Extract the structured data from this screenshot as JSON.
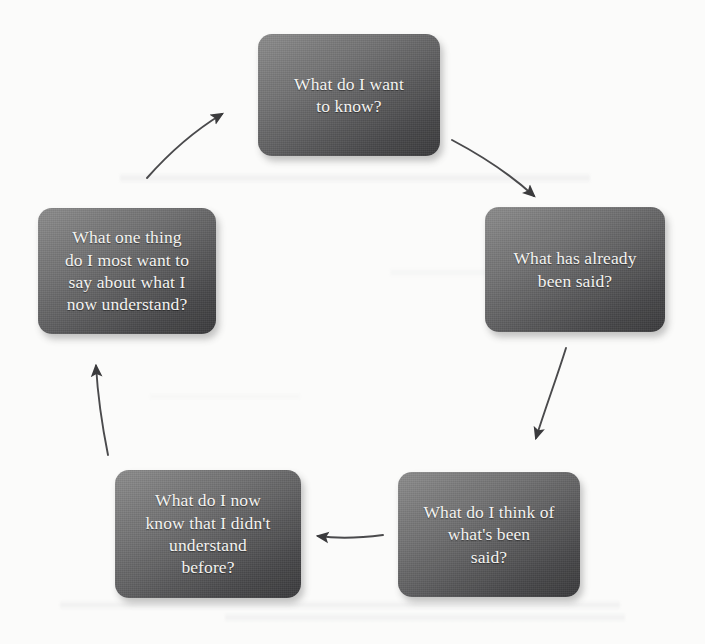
{
  "diagram": {
    "type": "cycle-flowchart",
    "direction": "clockwise",
    "background_color": "#fbfbfa",
    "node_color_light": "#8d8d8d",
    "node_color_dark": "#3a3a3c",
    "node_text_color": "#f4f3f0",
    "arrow_color": "#3b3b3d",
    "nodes": [
      {
        "id": "want-to-know",
        "text": "What do I want\nto know?"
      },
      {
        "id": "already-said",
        "text": "What has already\nbeen said?"
      },
      {
        "id": "what-i-think",
        "text": "What do I think of\nwhat's been\nsaid?"
      },
      {
        "id": "now-know",
        "text": "What do I now\nknow that I didn't\nunderstand\nbefore?"
      },
      {
        "id": "one-thing-to-say",
        "text": "What one thing\ndo I most want to\nsay about what I\nnow understand?"
      }
    ],
    "arrows": [
      {
        "id": "arrow-want-to-know-to-already-said",
        "from": "want-to-know",
        "to": "already-said"
      },
      {
        "id": "arrow-already-said-to-what-i-think",
        "from": "already-said",
        "to": "what-i-think"
      },
      {
        "id": "arrow-what-i-think-to-now-know",
        "from": "what-i-think",
        "to": "now-know"
      },
      {
        "id": "arrow-now-know-to-one-thing",
        "from": "now-know",
        "to": "one-thing-to-say"
      },
      {
        "id": "arrow-one-thing-to-want-to-know",
        "from": "one-thing-to-say",
        "to": "want-to-know"
      }
    ]
  }
}
